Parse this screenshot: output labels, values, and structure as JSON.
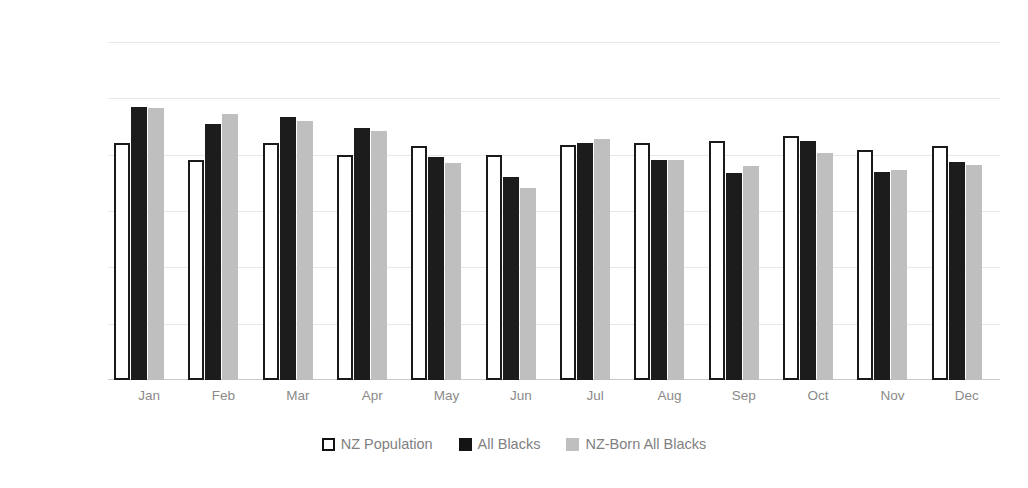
{
  "chart_data": {
    "type": "bar",
    "title": "",
    "xlabel": "",
    "ylabel": "Percentage of births by month",
    "ylim": [
      0,
      12
    ],
    "ytick_labels": [
      "0%",
      "2%",
      "4%",
      "6%",
      "8%",
      "10%",
      "12%"
    ],
    "ytick_values": [
      0,
      2,
      4,
      6,
      8,
      10,
      12
    ],
    "grid": true,
    "legend_position": "bottom",
    "categories": [
      "Jan",
      "Feb",
      "Mar",
      "Apr",
      "May",
      "Jun",
      "Jul",
      "Aug",
      "Sep",
      "Oct",
      "Nov",
      "Dec"
    ],
    "series": [
      {
        "name": "NZ Population",
        "color": "#ffffff",
        "edge_color": "#1a1a1a",
        "values": [
          8.4,
          7.8,
          8.4,
          8.0,
          8.3,
          8.0,
          8.35,
          8.4,
          8.5,
          8.65,
          8.15,
          8.3
        ]
      },
      {
        "name": "All Blacks",
        "color": "#1c1c1c",
        "edge_color": "#1c1c1c",
        "values": [
          9.7,
          9.1,
          9.35,
          8.95,
          7.9,
          7.2,
          8.4,
          7.8,
          7.35,
          8.5,
          7.4,
          7.75
        ]
      },
      {
        "name": "NZ-Born All Blacks",
        "color": "#bfbfbf",
        "edge_color": "#bfbfbf",
        "values": [
          9.65,
          9.45,
          9.2,
          8.85,
          7.7,
          6.8,
          8.55,
          7.8,
          7.6,
          8.05,
          7.45,
          7.65
        ]
      }
    ]
  },
  "legend": {
    "items": [
      {
        "label": "NZ Population",
        "style": "outlined"
      },
      {
        "label": "All Blacks",
        "style": "black"
      },
      {
        "label": "NZ-Born All Blacks",
        "style": "gray"
      }
    ]
  },
  "colors": {
    "background": "#ffffff",
    "grid": "#e8e8e8",
    "axis": "#c9c9c9",
    "tick_text": "#8d8d8d",
    "label_text": "#8a8a8a",
    "legend_text": "#7f7f7f",
    "series_outline": "#1a1a1a",
    "series_black": "#1c1c1c",
    "series_gray": "#bfbfbf"
  }
}
